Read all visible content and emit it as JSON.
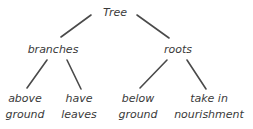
{
  "diagram": {
    "type": "tree",
    "line_color": "#4a4a4a",
    "text_color": "#3a3a3a",
    "root": {
      "label": "Tree",
      "x": 115,
      "y": 5
    },
    "level1": [
      {
        "label": "branches",
        "x": 53,
        "y": 42
      },
      {
        "label": "roots",
        "x": 178,
        "y": 42
      }
    ],
    "level2": [
      {
        "lines": [
          "above",
          "ground"
        ],
        "x": 25,
        "y": 91
      },
      {
        "lines": [
          "have",
          "leaves"
        ],
        "x": 79,
        "y": 91
      },
      {
        "lines": [
          "below",
          "ground"
        ],
        "x": 138,
        "y": 91
      },
      {
        "lines": [
          "take in",
          "nourishment"
        ],
        "x": 209,
        "y": 91
      }
    ],
    "edges": [
      {
        "from": "Tree",
        "to": "branches",
        "x1": 91,
        "y1": 15,
        "x2": 61,
        "y2": 37
      },
      {
        "from": "Tree",
        "to": "roots",
        "x1": 137,
        "y1": 15,
        "x2": 169,
        "y2": 38
      },
      {
        "from": "branches",
        "to": "above ground",
        "x1": 47,
        "y1": 60,
        "x2": 27,
        "y2": 88
      },
      {
        "from": "branches",
        "to": "have leaves",
        "x1": 67,
        "y1": 60,
        "x2": 81,
        "y2": 89
      },
      {
        "from": "roots",
        "to": "below ground",
        "x1": 167,
        "y1": 60,
        "x2": 140,
        "y2": 88
      },
      {
        "from": "roots",
        "to": "take in nourishment",
        "x1": 187,
        "y1": 60,
        "x2": 206,
        "y2": 89
      }
    ]
  }
}
